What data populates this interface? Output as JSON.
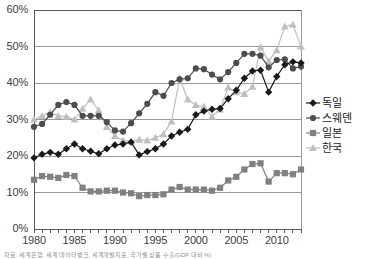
{
  "chart_data": {
    "type": "line",
    "title": "",
    "subtitle": "",
    "xlabel": "",
    "ylabel": "",
    "xlim": [
      1980,
      2013
    ],
    "ylim": [
      0,
      60
    ],
    "grid": true,
    "grid_axis": "y",
    "legend_position": "right",
    "y_ticks": [
      "0%",
      "10%",
      "20%",
      "30%",
      "40%",
      "50%",
      "60%"
    ],
    "y_tick_values": [
      0,
      10,
      20,
      30,
      40,
      50,
      60
    ],
    "x_ticks": [
      "1980",
      "1985",
      "1990",
      "1995",
      "2000",
      "2005",
      "2010"
    ],
    "x_tick_values": [
      1980,
      1985,
      1990,
      1995,
      2000,
      2005,
      2010
    ],
    "x": [
      1980,
      1981,
      1982,
      1983,
      1984,
      1985,
      1986,
      1987,
      1988,
      1989,
      1990,
      1991,
      1992,
      1993,
      1994,
      1995,
      1996,
      1997,
      1998,
      1999,
      2000,
      2001,
      2002,
      2003,
      2004,
      2005,
      2006,
      2007,
      2008,
      2009,
      2010,
      2011,
      2012,
      2013
    ],
    "series": [
      {
        "name": "독일",
        "marker": "diamond",
        "color": "#1a1a1a",
        "values": [
          19.5,
          20.5,
          21.0,
          20.5,
          22.0,
          23.3,
          22.0,
          21.3,
          20.6,
          22.0,
          23.0,
          23.3,
          23.8,
          20.3,
          21.2,
          22.0,
          23.3,
          25.5,
          26.5,
          27.3,
          31.3,
          32.3,
          32.8,
          33.0,
          35.7,
          38.0,
          41.3,
          43.3,
          43.5,
          37.5,
          41.8,
          45.0,
          45.8,
          45.5
        ]
      },
      {
        "name": "스웨덴",
        "marker": "circle",
        "color": "#4d4d4d",
        "values": [
          28.0,
          28.8,
          31.3,
          34.0,
          34.8,
          34.0,
          31.0,
          31.0,
          31.0,
          29.3,
          27.0,
          26.7,
          29.0,
          31.7,
          34.3,
          37.5,
          36.5,
          40.0,
          41.0,
          41.3,
          44.0,
          43.8,
          42.3,
          41.0,
          43.0,
          45.5,
          48.0,
          48.0,
          47.5,
          44.3,
          46.3,
          46.5,
          44.0,
          44.5
        ]
      },
      {
        "name": "일본",
        "marker": "square",
        "color": "#808080",
        "values": [
          13.5,
          14.5,
          14.3,
          14.0,
          14.8,
          14.5,
          11.3,
          10.3,
          10.3,
          10.5,
          10.5,
          10.0,
          9.8,
          9.0,
          9.3,
          9.3,
          9.5,
          10.8,
          11.5,
          10.8,
          10.8,
          10.8,
          10.5,
          11.3,
          13.3,
          14.3,
          16.3,
          17.8,
          18.0,
          13.0,
          15.3,
          15.3,
          15.0,
          16.3
        ]
      },
      {
        "name": "한국",
        "marker": "triangle",
        "color": "#bfbfbf",
        "values": [
          30.0,
          31.0,
          32.0,
          31.0,
          30.8,
          30.0,
          33.0,
          35.5,
          32.5,
          28.0,
          25.5,
          24.3,
          24.0,
          24.5,
          24.3,
          25.0,
          26.0,
          29.5,
          41.3,
          35.5,
          34.0,
          33.5,
          30.8,
          32.8,
          38.8,
          37.5,
          37.0,
          39.0,
          49.8,
          46.0,
          49.0,
          55.5,
          56.0,
          50.0
        ]
      }
    ]
  },
  "legend": {
    "items": [
      {
        "label": "독일",
        "marker": "diamond"
      },
      {
        "label": "스웨덴",
        "marker": "circle"
      },
      {
        "label": "일본",
        "marker": "square"
      },
      {
        "label": "한국",
        "marker": "triangle"
      }
    ]
  },
  "caption": {
    "text": "자료: 세계은행, 세계 데이터뱅크, 세계개발지표, 국가별 상품 수출(GDP 대비 %)"
  }
}
